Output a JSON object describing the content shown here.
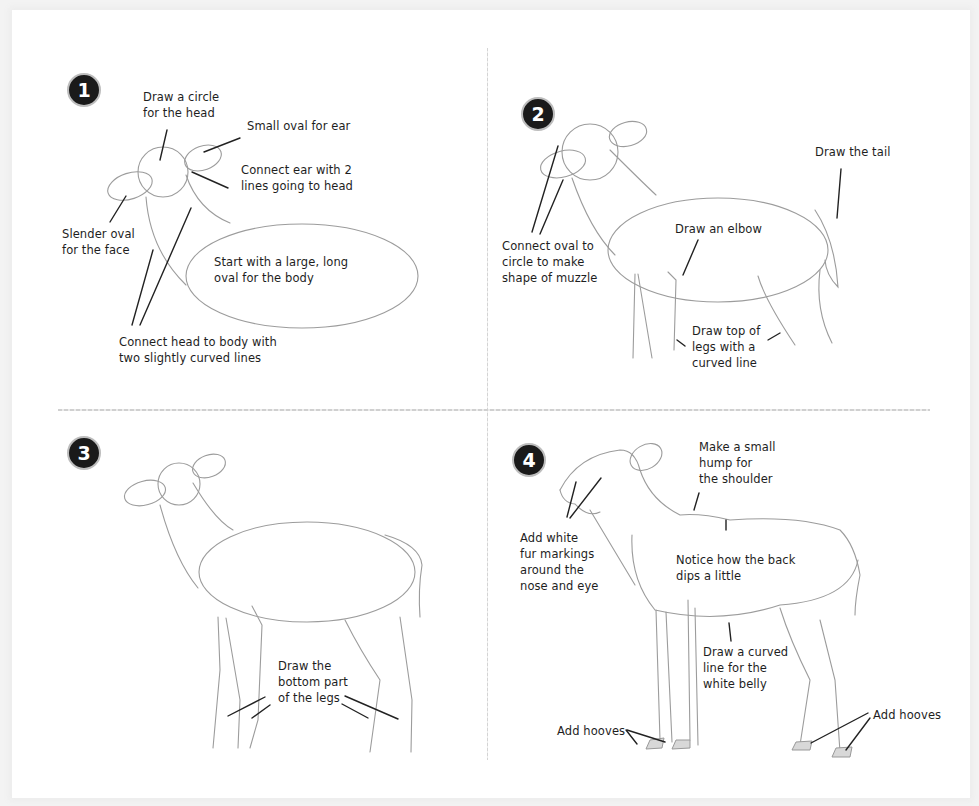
{
  "tutorial": {
    "subject": "How to draw a deer",
    "steps": [
      {
        "number": "1",
        "notes": {
          "head": "Draw a circle\nfor the head",
          "ear": "Small oval for ear",
          "connect_ear": "Connect ear with 2\nlines going to head",
          "face": "Slender oval\nfor the face",
          "body": "Start with a large, long\noval for the body",
          "neck": "Connect head to body with\ntwo slightly curved lines"
        }
      },
      {
        "number": "2",
        "notes": {
          "muzzle": "Connect oval to\ncircle to make\nshape of muzzle",
          "tail": "Draw the tail",
          "elbow": "Draw an elbow",
          "legs_top": "Draw top of\nlegs with a\ncurved line"
        }
      },
      {
        "number": "3",
        "notes": {
          "legs_bottom": "Draw the\nbottom part\nof the legs"
        }
      },
      {
        "number": "4",
        "notes": {
          "shoulder": "Make a small\nhump for\nthe shoulder",
          "fur": "Add white\nfur markings\naround the\nnose and eye",
          "back": "Notice how the back\ndips a little",
          "belly": "Draw a curved\nline for the\nwhite belly",
          "hooves_front": "Add hooves",
          "hooves_back": "Add hooves"
        }
      }
    ]
  }
}
